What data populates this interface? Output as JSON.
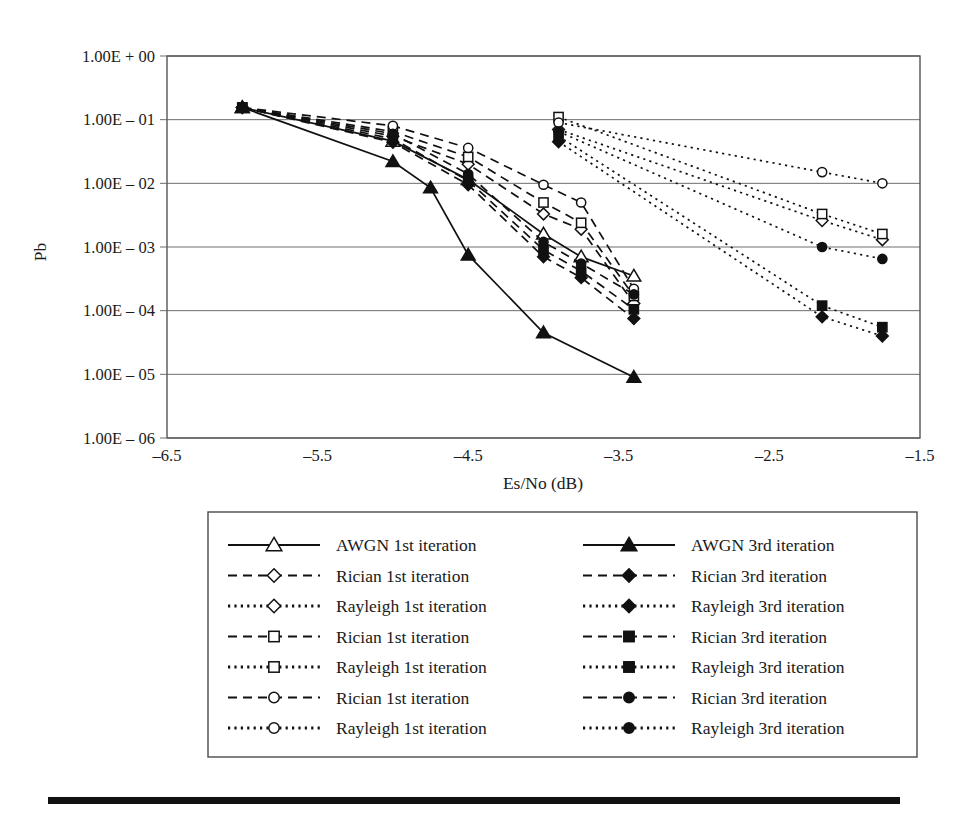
{
  "figure": {
    "ylabel": "Pb",
    "xlabel": "Es/No (dB)"
  },
  "axes": {
    "yticks": [
      "1.00E + 00",
      "1.00E – 01",
      "1.00E – 02",
      "1.00E – 03",
      "1.00E – 04",
      "1.00E – 05",
      "1.00E – 06"
    ],
    "xticks": [
      "–6.5",
      "–5.5",
      "–4.5",
      "–3.5",
      "–2.5",
      "–1.5"
    ]
  },
  "legend": {
    "entries": [
      {
        "label": "AWGN 1st iteration",
        "marker": "triangle",
        "fill": "open",
        "line": "solid"
      },
      {
        "label": "AWGN 3rd iteration",
        "marker": "triangle",
        "fill": "filled",
        "line": "solid"
      },
      {
        "label": "Rician 1st iteration",
        "marker": "diamond",
        "fill": "open",
        "line": "dashed"
      },
      {
        "label": "Rician 3rd iteration",
        "marker": "diamond",
        "fill": "filled",
        "line": "dashed"
      },
      {
        "label": "Rayleigh 1st iteration",
        "marker": "diamond",
        "fill": "open",
        "line": "dotted"
      },
      {
        "label": "Rayleigh 3rd iteration",
        "marker": "diamond",
        "fill": "filled",
        "line": "dotted"
      },
      {
        "label": "Rician 1st iteration",
        "marker": "square",
        "fill": "open",
        "line": "dashed"
      },
      {
        "label": "Rician 3rd iteration",
        "marker": "square",
        "fill": "filled",
        "line": "dashed"
      },
      {
        "label": "Rayleigh 1st iteration",
        "marker": "square",
        "fill": "open",
        "line": "dotted"
      },
      {
        "label": "Rayleigh 3rd iteration",
        "marker": "square",
        "fill": "filled",
        "line": "dotted"
      },
      {
        "label": "Rician 1st iteration",
        "marker": "circle",
        "fill": "open",
        "line": "dashed"
      },
      {
        "label": "Rician 3rd iteration",
        "marker": "circle",
        "fill": "filled",
        "line": "dashed"
      },
      {
        "label": "Rayleigh 1st iteration",
        "marker": "circle",
        "fill": "open",
        "line": "dotted"
      },
      {
        "label": "Rayleigh 3rd iteration",
        "marker": "circle",
        "fill": "filled",
        "line": "dotted"
      }
    ]
  },
  "chart_data": {
    "type": "line",
    "title": "",
    "xlabel": "Es/No (dB)",
    "ylabel": "Pb",
    "yscale": "log",
    "xlim": [
      -6.5,
      -1.5
    ],
    "ylim": [
      1e-06,
      1.0
    ],
    "grid": "horizontal",
    "legend_position": "below",
    "series": [
      {
        "name": "AWGN 1st iteration",
        "marker": "triangle",
        "fill": "open",
        "line": "solid",
        "x": [
          -6.0,
          -5.0,
          -4.5,
          -4.0,
          -3.75,
          -3.4
        ],
        "y": [
          0.155,
          0.046,
          0.0115,
          0.0016,
          0.0007,
          0.00035
        ]
      },
      {
        "name": "AWGN 3rd iteration",
        "marker": "triangle",
        "fill": "filled",
        "line": "solid",
        "x": [
          -6.0,
          -5.0,
          -4.75,
          -4.5,
          -4.0,
          -3.4
        ],
        "y": [
          0.155,
          0.022,
          0.0085,
          0.00075,
          4.5e-05,
          9e-06
        ]
      },
      {
        "name": "Rician 1st iteration (diamond)",
        "marker": "diamond",
        "fill": "open",
        "line": "dashed",
        "x": [
          -6.0,
          -5.0,
          -4.5,
          -4.0,
          -3.75,
          -3.4
        ],
        "y": [
          0.155,
          0.055,
          0.02,
          0.0033,
          0.0019,
          0.00013
        ]
      },
      {
        "name": "Rician 3rd iteration (diamond)",
        "marker": "diamond",
        "fill": "filled",
        "line": "dashed",
        "x": [
          -6.0,
          -5.0,
          -4.5,
          -4.0,
          -3.75,
          -3.4
        ],
        "y": [
          0.155,
          0.044,
          0.0095,
          0.0007,
          0.00033,
          7.5e-05
        ]
      },
      {
        "name": "Rician 1st iteration (square)",
        "marker": "square",
        "fill": "open",
        "line": "dashed",
        "x": [
          -6.0,
          -5.0,
          -4.5,
          -4.0,
          -3.75,
          -3.4
        ],
        "y": [
          0.155,
          0.065,
          0.026,
          0.005,
          0.0024,
          0.00017
        ]
      },
      {
        "name": "Rician 3rd iteration (square)",
        "marker": "square",
        "fill": "filled",
        "line": "dashed",
        "x": [
          -6.0,
          -5.0,
          -4.5,
          -4.0,
          -3.75,
          -3.4
        ],
        "y": [
          0.155,
          0.05,
          0.011,
          0.0009,
          0.00042,
          0.000105
        ]
      },
      {
        "name": "Rician 1st iteration (circle)",
        "marker": "circle",
        "fill": "open",
        "line": "dashed",
        "x": [
          -6.0,
          -5.0,
          -4.5,
          -4.0,
          -3.75,
          -3.4
        ],
        "y": [
          0.155,
          0.08,
          0.036,
          0.0095,
          0.005,
          0.00022
        ]
      },
      {
        "name": "Rician 3rd iteration (circle)",
        "marker": "circle",
        "fill": "filled",
        "line": "dashed",
        "x": [
          -6.0,
          -5.0,
          -4.5,
          -4.0,
          -3.75,
          -3.4
        ],
        "y": [
          0.155,
          0.06,
          0.014,
          0.0012,
          0.00055,
          0.00018
        ]
      },
      {
        "name": "Rayleigh 1st iteration (diamond)",
        "marker": "diamond",
        "fill": "open",
        "line": "dotted",
        "x": [
          -3.9,
          -2.15,
          -1.75
        ],
        "y": [
          0.07,
          0.0026,
          0.0013
        ]
      },
      {
        "name": "Rayleigh 3rd iteration (diamond)",
        "marker": "diamond",
        "fill": "filled",
        "line": "dotted",
        "x": [
          -3.9,
          -2.15,
          -1.75
        ],
        "y": [
          0.045,
          8e-05,
          4e-05
        ]
      },
      {
        "name": "Rayleigh 1st iteration (square)",
        "marker": "square",
        "fill": "open",
        "line": "dotted",
        "x": [
          -3.9,
          -2.15,
          -1.75
        ],
        "y": [
          0.11,
          0.0033,
          0.0016
        ]
      },
      {
        "name": "Rayleigh 3rd iteration (square)",
        "marker": "square",
        "fill": "filled",
        "line": "dotted",
        "x": [
          -3.9,
          -2.15,
          -1.75
        ],
        "y": [
          0.055,
          0.00012,
          5.5e-05
        ]
      },
      {
        "name": "Rayleigh 1st iteration (circle)",
        "marker": "circle",
        "fill": "open",
        "line": "dotted",
        "x": [
          -3.9,
          -2.15,
          -1.75
        ],
        "y": [
          0.09,
          0.015,
          0.01
        ]
      },
      {
        "name": "Rayleigh 3rd iteration (circle)",
        "marker": "circle",
        "fill": "filled",
        "line": "dotted",
        "x": [
          -3.9,
          -2.15,
          -1.75
        ],
        "y": [
          0.065,
          0.001,
          0.00065
        ]
      }
    ]
  }
}
